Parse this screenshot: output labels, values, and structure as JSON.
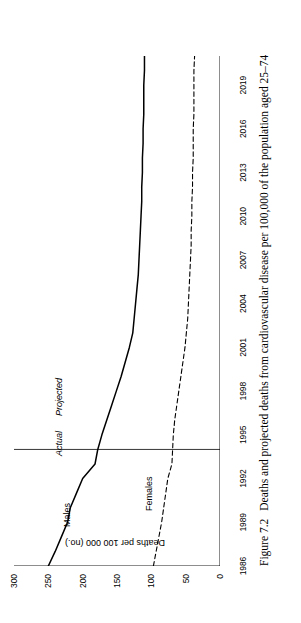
{
  "figure": {
    "caption_number": "Figure 7.2",
    "caption_text": "Deaths and projected deaths from cardiovascular disease per 100,000 of the population aged 25–74"
  },
  "annotations": {
    "actual_label": "Actual",
    "projected_label": "Projected",
    "males_label": "Males",
    "females_label": "Females"
  },
  "chart_data": {
    "type": "line",
    "title": "",
    "xlabel": "",
    "ylabel": "Deaths per 100 000 (no.)",
    "xlim": [
      1986,
      2021
    ],
    "ylim": [
      0,
      300
    ],
    "grid": false,
    "legend": "inline-annotations",
    "x_tick_labels": [
      "1986",
      "1989",
      "1992",
      "1995",
      "1998",
      "2001",
      "2004",
      "2007",
      "2010",
      "2013",
      "2016",
      "2019"
    ],
    "x_tick_values": [
      1986,
      1989,
      1992,
      1995,
      1998,
      2001,
      2004,
      2007,
      2010,
      2013,
      2016,
      2019
    ],
    "x_minor_tick_interval": 1,
    "y_tick_labels": [
      "0",
      "50",
      "100",
      "150",
      "200",
      "250",
      "300"
    ],
    "y_tick_values": [
      0,
      50,
      100,
      150,
      200,
      250,
      300
    ],
    "divider_year": 1994,
    "divider_caption_left": "Actual",
    "divider_caption_right": "Projected",
    "x": [
      1986,
      1987,
      1988,
      1989,
      1990,
      1991,
      1992,
      1993,
      1994,
      1995,
      1996,
      1997,
      1998,
      1999,
      2000,
      2001,
      2002,
      2003,
      2004,
      2005,
      2006,
      2007,
      2008,
      2009,
      2010,
      2011,
      2012,
      2013,
      2014,
      2015,
      2016,
      2017,
      2018,
      2019,
      2020,
      2021
    ],
    "series": [
      {
        "name": "Males",
        "style": "solid",
        "color": "#000000",
        "values": [
          250,
          240,
          231,
          222,
          218,
          209,
          200,
          182,
          178,
          172,
          165,
          158,
          151,
          144,
          138,
          132,
          127,
          125,
          123,
          121,
          119,
          118,
          117,
          116,
          115,
          114,
          114,
          113,
          113,
          112,
          112,
          111,
          111,
          111,
          110,
          110
        ]
      },
      {
        "name": "Females",
        "style": "dashed",
        "color": "#000000",
        "values": [
          97,
          93,
          89,
          85,
          82,
          79,
          76,
          70,
          69,
          68,
          66,
          63,
          60,
          57,
          54,
          51,
          49,
          47,
          46,
          45,
          44,
          43,
          42,
          42,
          41,
          41,
          40,
          40,
          39,
          39,
          39,
          38,
          38,
          38,
          38,
          37
        ]
      }
    ]
  }
}
